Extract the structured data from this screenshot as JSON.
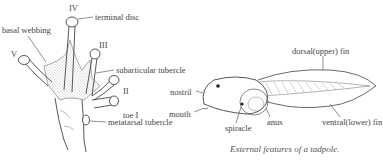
{
  "foot": {
    "labels": {
      "toe_iv": "IV",
      "toe_iii": "III",
      "toe_ii": "II",
      "toe_v": "V",
      "terminal_disc": "terminal disc",
      "basal_webbing": "basal webbing",
      "subarticular_tubercle": "subarticular tubercle",
      "toe_i": "toe I",
      "metatarsal_tubercle": "metatarsal tubercle"
    }
  },
  "tadpole": {
    "labels": {
      "dorsal_fin": "dorsal(upper) fin",
      "nostril": "nostril",
      "mouth": "mouth",
      "spiracle": "spiracle",
      "anus": "anus",
      "ventral_fin": "ventral(lower) fin"
    },
    "caption": "External features of a tadpole."
  },
  "colors": {
    "line": "#444444",
    "stipple": "#888888",
    "background": "#ffffff"
  }
}
